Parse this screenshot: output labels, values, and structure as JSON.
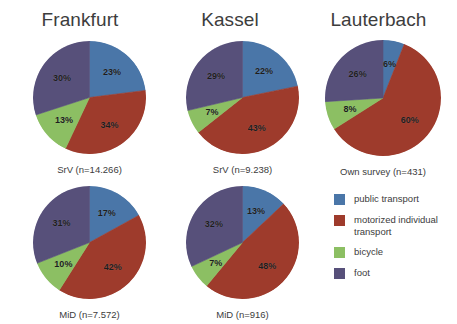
{
  "figure": {
    "title": "",
    "columns": [
      {
        "id": "frankfurt",
        "label": "Frankfurt"
      },
      {
        "id": "kassel",
        "label": "Kassel"
      },
      {
        "id": "lauterbach",
        "label": "Lauterbach"
      }
    ]
  },
  "legend": {
    "position": "right",
    "items": [
      {
        "label": "public transport",
        "color": "#4A76A8"
      },
      {
        "label": "motorized individual transport",
        "color": "#9E3B2C"
      },
      {
        "label": "bicycle",
        "color": "#8CBF63"
      },
      {
        "label": "foot",
        "color": "#57507A"
      }
    ]
  },
  "charts": {
    "fra_srv": {
      "caption": "SrV (n=14.266)",
      "labels": [
        "23%",
        "34%",
        "13%",
        "30%"
      ]
    },
    "kas_srv": {
      "caption": "SrV (n=9.238)",
      "labels": [
        "22%",
        "43%",
        "7%",
        "29%"
      ]
    },
    "lau_own": {
      "caption": "Own survey (n=431)",
      "labels": [
        "6%",
        "60%",
        "8%",
        "26%"
      ]
    },
    "fra_mid": {
      "caption": "MiD (n=7.572)",
      "labels": [
        "17%",
        "42%",
        "10%",
        "31%"
      ]
    },
    "kas_mid": {
      "caption": "MiD (n=916)",
      "labels": [
        "13%",
        "48%",
        "7%",
        "32%"
      ]
    }
  },
  "chart_data": [
    {
      "type": "pie",
      "id": "fra_srv",
      "title": "Frankfurt",
      "subtitle": "SrV (n=14.266)",
      "n": 14266,
      "categories": [
        "public transport",
        "motorized individual transport",
        "bicycle",
        "foot"
      ],
      "values": [
        23,
        34,
        13,
        30
      ],
      "unit": "%",
      "colors": [
        "#4A76A8",
        "#9E3B2C",
        "#8CBF63",
        "#57507A"
      ],
      "start_angle_deg": 0,
      "direction": "clockwise"
    },
    {
      "type": "pie",
      "id": "kas_srv",
      "title": "Kassel",
      "subtitle": "SrV (n=9.238)",
      "n": 9238,
      "categories": [
        "public transport",
        "motorized individual transport",
        "bicycle",
        "foot"
      ],
      "values": [
        22,
        43,
        7,
        29
      ],
      "unit": "%",
      "colors": [
        "#4A76A8",
        "#9E3B2C",
        "#8CBF63",
        "#57507A"
      ],
      "start_angle_deg": 0,
      "direction": "clockwise"
    },
    {
      "type": "pie",
      "id": "lau_own",
      "title": "Lauterbach",
      "subtitle": "Own survey (n=431)",
      "n": 431,
      "categories": [
        "public transport",
        "motorized individual transport",
        "bicycle",
        "foot"
      ],
      "values": [
        6,
        60,
        8,
        26
      ],
      "unit": "%",
      "colors": [
        "#4A76A8",
        "#9E3B2C",
        "#8CBF63",
        "#57507A"
      ],
      "start_angle_deg": 0,
      "direction": "clockwise"
    },
    {
      "type": "pie",
      "id": "fra_mid",
      "title": "Frankfurt",
      "subtitle": "MiD (n=7.572)",
      "n": 7572,
      "categories": [
        "public transport",
        "motorized individual transport",
        "bicycle",
        "foot"
      ],
      "values": [
        17,
        42,
        10,
        31
      ],
      "unit": "%",
      "colors": [
        "#4A76A8",
        "#9E3B2C",
        "#8CBF63",
        "#57507A"
      ],
      "start_angle_deg": 0,
      "direction": "clockwise"
    },
    {
      "type": "pie",
      "id": "kas_mid",
      "title": "Kassel",
      "subtitle": "MiD (n=916)",
      "n": 916,
      "categories": [
        "public transport",
        "motorized individual transport",
        "bicycle",
        "foot"
      ],
      "values": [
        13,
        48,
        7,
        32
      ],
      "unit": "%",
      "colors": [
        "#4A76A8",
        "#9E3B2C",
        "#8CBF63",
        "#57507A"
      ],
      "start_angle_deg": 0,
      "direction": "clockwise"
    }
  ]
}
